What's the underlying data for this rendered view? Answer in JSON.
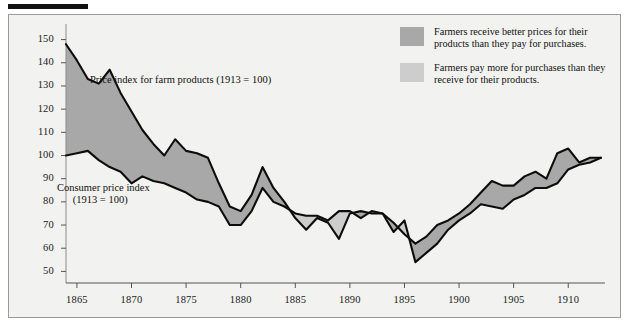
{
  "figure": {
    "background": "#f2f2f0",
    "frame_color": "#9a9a9a",
    "rule_color": "#111111"
  },
  "legend": {
    "position": "top-right",
    "items": [
      {
        "swatch": "#a8a8a8",
        "swatch_tone": "dark",
        "text": "Farmers receive better prices for their\nproducts than they pay for purchases."
      },
      {
        "swatch": "#cdcdcd",
        "swatch_tone": "light",
        "text": "Farmers pay more for purchases than\nthey receive for their products."
      }
    ]
  },
  "annotations": [
    {
      "name": "farm-series-label",
      "text": "Price index for farm products (1913 = 100)",
      "x": 90,
      "y": 74
    },
    {
      "name": "consumer-series-label",
      "text": "Consumer price index\n      (1913 = 100)",
      "x": 57,
      "y": 182
    }
  ],
  "chart_data": {
    "type": "area",
    "title": "",
    "subtitle": "",
    "xlabel": "",
    "ylabel": "",
    "xlim": [
      1864,
      1913
    ],
    "ylim": [
      45,
      155
    ],
    "grid": false,
    "legend_position": "top-right",
    "yticks": [
      50,
      60,
      70,
      80,
      90,
      100,
      110,
      120,
      130,
      140,
      150
    ],
    "xticks": [
      1865,
      1870,
      1875,
      1880,
      1885,
      1890,
      1895,
      1900,
      1905,
      1910
    ],
    "x": [
      1864,
      1865,
      1866,
      1867,
      1868,
      1869,
      1870,
      1871,
      1872,
      1873,
      1874,
      1875,
      1876,
      1877,
      1878,
      1879,
      1880,
      1881,
      1882,
      1883,
      1884,
      1885,
      1886,
      1887,
      1888,
      1889,
      1890,
      1891,
      1892,
      1893,
      1894,
      1895,
      1896,
      1897,
      1898,
      1899,
      1900,
      1901,
      1902,
      1903,
      1904,
      1905,
      1906,
      1907,
      1908,
      1909,
      1910,
      1911,
      1912,
      1913
    ],
    "series": [
      {
        "name": "Price index for farm products (1913 = 100)",
        "note": "1913 = 100",
        "values": [
          148,
          141,
          133,
          131,
          137,
          127,
          119,
          111,
          105,
          100,
          107,
          102,
          101,
          99,
          88,
          78,
          76,
          83,
          95,
          86,
          80,
          73,
          68,
          73,
          71,
          64,
          75,
          76,
          75,
          75,
          71,
          66,
          62,
          65,
          70,
          72,
          75,
          79,
          84,
          89,
          87,
          87,
          91,
          93,
          90,
          101,
          103,
          97,
          99,
          99
        ]
      },
      {
        "name": "Consumer price index (1913 = 100)",
        "note": "1913 = 100",
        "values": [
          100,
          101,
          102,
          98,
          95,
          93,
          88,
          91,
          89,
          88,
          86,
          84,
          81,
          80,
          78,
          70,
          70,
          76,
          86,
          80,
          78,
          75,
          74,
          74,
          72,
          76,
          76,
          73,
          76,
          75,
          67,
          72,
          54,
          58,
          62,
          68,
          72,
          75,
          79,
          78,
          77,
          81,
          83,
          86,
          86,
          88,
          94,
          96,
          97,
          99
        ]
      }
    ],
    "fill_rules": {
      "farm_above_consumer": {
        "color": "#a8a8a8",
        "meaning": "Farmers receive better prices for their products than they pay for purchases."
      },
      "consumer_above_farm": {
        "color": "#cdcdcd",
        "meaning": "Farmers pay more for purchases than they receive for their products."
      }
    }
  }
}
